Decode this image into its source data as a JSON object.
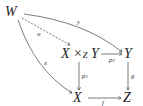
{
  "diagram": {
    "type": "commutative-diagram",
    "nodes": {
      "W": "W",
      "pullback_base_left": "X ×",
      "pullback_sub": "Z",
      "pullback_base_right": " Y",
      "Y": "Y",
      "X": "X",
      "Z": "Z"
    },
    "arrows": {
      "u": {
        "label": "u",
        "from": "W",
        "to": "X ×_Z Y",
        "style": "dashed"
      },
      "y": {
        "label": "y",
        "from": "W",
        "to": "Y",
        "style": "solid"
      },
      "x": {
        "label": "x",
        "from": "W",
        "to": "X",
        "style": "solid"
      },
      "p2": {
        "label": "p",
        "sub": "2",
        "from": "X ×_Z Y",
        "to": "Y",
        "style": "solid"
      },
      "p1": {
        "label": "p",
        "sub": "1",
        "from": "X ×_Z Y",
        "to": "X",
        "style": "solid"
      },
      "g": {
        "label": "g",
        "from": "Y",
        "to": "Z",
        "style": "solid"
      },
      "f": {
        "label": "f",
        "from": "X",
        "to": "Z",
        "style": "solid"
      }
    },
    "colors": {
      "ink": "#222222",
      "background": "#ffffff"
    }
  }
}
